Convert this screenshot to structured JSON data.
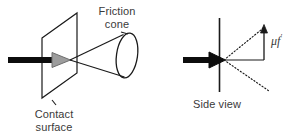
{
  "figure": {
    "background_color": "#ffffff",
    "width": 301,
    "height": 138
  },
  "labels": {
    "friction_cone": "Friction\ncone",
    "contact_surface": "Contact\nsurface",
    "side_view": "Side view",
    "mu_f_base": "μf",
    "mu_f_prime": "′"
  },
  "colors": {
    "stroke": "#1a1a1a",
    "text": "#3a3a3a",
    "arrow_fill_left": "#9a9a9a",
    "arrow_fill_right": "#000000",
    "background": "#ffffff"
  },
  "left_diagram": {
    "name": "contact-surface-and-friction-cone",
    "surface_plane_points": "42,38 77,13 77,73 42,98",
    "force_arrow_shaft": {
      "x1": 8,
      "y1": 60,
      "x2": 52,
      "y2": 60,
      "width": 6
    },
    "force_arrow_head": "52,52 52,68 70,60",
    "cone_apex": {
      "x": 70,
      "y": 60
    },
    "cone_upper_edge": {
      "x1": 70,
      "y1": 60,
      "x2": 122,
      "y2": 34
    },
    "cone_lower_edge": {
      "x1": 70,
      "y1": 60,
      "x2": 124,
      "y2": 77
    },
    "cone_base_ellipse": {
      "cx": 127,
      "cy": 55,
      "rx": 10,
      "ry": 22,
      "rotate": 8
    }
  },
  "right_diagram": {
    "name": "side-view-friction-cone",
    "wall_line": {
      "x1": 219,
      "y1": 18,
      "x2": 219,
      "y2": 92
    },
    "force_arrow_shaft": {
      "x1": 183,
      "y1": 60,
      "x2": 209,
      "y2": 60,
      "width": 6
    },
    "force_arrow_head": "209,52 209,68 225,60",
    "contact_point": {
      "x": 224,
      "y": 60
    },
    "normal_line": {
      "x1": 224,
      "y1": 60,
      "x2": 264,
      "y2": 60
    },
    "cone_edge_upper_dotted": {
      "x1": 224,
      "y1": 60,
      "x2": 264,
      "y2": 27
    },
    "cone_edge_lower_dotted": {
      "x1": 224,
      "y1": 60,
      "x2": 268,
      "y2": 90
    },
    "tangential_vector": {
      "x1": 264,
      "y1": 60,
      "x2": 264,
      "y2": 27
    },
    "tangential_arrow_head": "260,33 268,33 264,25"
  }
}
